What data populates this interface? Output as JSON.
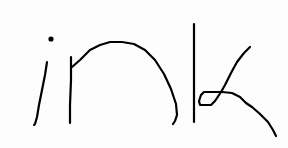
{
  "drawing": {
    "recognized_text": "ink",
    "ink_color": "#000000",
    "background_color": "#fdfdfd",
    "letters": [
      "i",
      "n",
      "k"
    ]
  }
}
